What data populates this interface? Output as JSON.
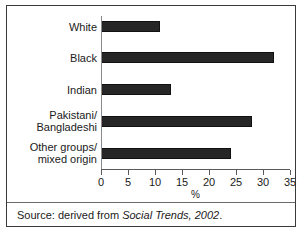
{
  "chart_data": {
    "type": "bar",
    "orientation": "horizontal",
    "title": "",
    "subtitle": "",
    "xlabel": "%",
    "ylabel": "",
    "xlim": [
      0,
      35
    ],
    "xticks": [
      0,
      5,
      10,
      15,
      20,
      25,
      30,
      35
    ],
    "xtick_labels": [
      "0",
      "5",
      "10",
      "15",
      "20",
      "25",
      "30",
      "35"
    ],
    "grid": false,
    "legend": false,
    "legend_position": "none",
    "categories": [
      "White",
      "Black",
      "Indian",
      "Pakistani/ Bangladeshi",
      "Other groups/ mixed origin"
    ],
    "category_lines": [
      [
        "White"
      ],
      [
        "Black"
      ],
      [
        "Indian"
      ],
      [
        "Pakistani/",
        "Bangladeshi"
      ],
      [
        "Other groups/",
        "mixed origin"
      ]
    ],
    "values": [
      11,
      32,
      13,
      28,
      24
    ],
    "bar_color": "#262626",
    "bar_edge_color": "#111111",
    "axis_color": "#5a5a5a",
    "background": "#ffffff"
  },
  "caption": {
    "prefix": "Source: derived from ",
    "italic_title": "Social Trends, 2002",
    "suffix": "."
  }
}
